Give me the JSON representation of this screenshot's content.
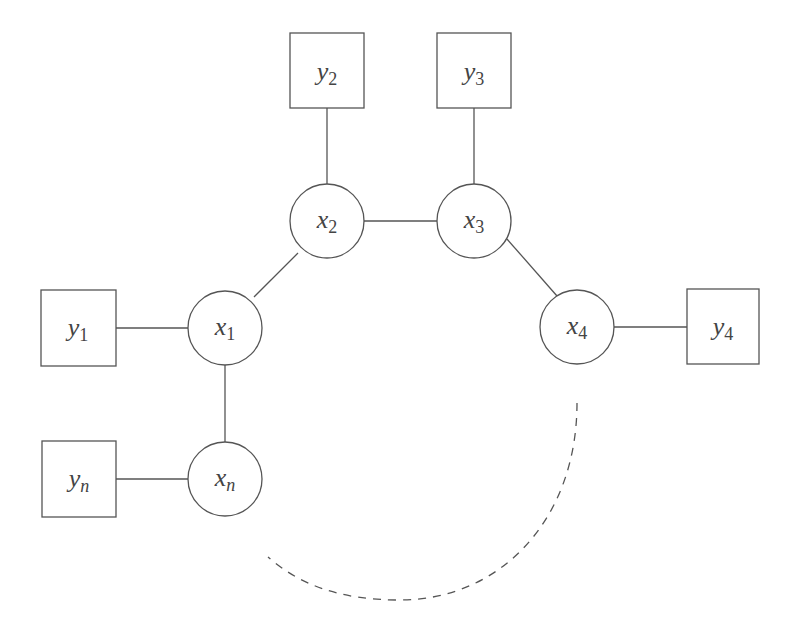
{
  "diagram": {
    "type": "graphical-model",
    "hidden_nodes": [
      {
        "id": "x1",
        "var": "x",
        "sub": "1",
        "cx": 225,
        "cy": 328
      },
      {
        "id": "x2",
        "var": "x",
        "sub": "2",
        "cx": 327,
        "cy": 221
      },
      {
        "id": "x3",
        "var": "x",
        "sub": "3",
        "cx": 474,
        "cy": 221
      },
      {
        "id": "x4",
        "var": "x",
        "sub": "4",
        "cx": 577,
        "cy": 327
      },
      {
        "id": "xn",
        "var": "x",
        "sub": "n",
        "cx": 225,
        "cy": 479
      }
    ],
    "observed_nodes": [
      {
        "id": "y1",
        "var": "y",
        "sub": "1"
      },
      {
        "id": "y2",
        "var": "y",
        "sub": "2"
      },
      {
        "id": "y3",
        "var": "y",
        "sub": "3"
      },
      {
        "id": "y4",
        "var": "y",
        "sub": "4"
      },
      {
        "id": "yn",
        "var": "y",
        "sub": "n"
      }
    ],
    "edges": [
      [
        "y1",
        "x1"
      ],
      [
        "y2",
        "x2"
      ],
      [
        "y3",
        "x3"
      ],
      [
        "y4",
        "x4"
      ],
      [
        "yn",
        "xn"
      ],
      [
        "x1",
        "x2"
      ],
      [
        "x2",
        "x3"
      ],
      [
        "x3",
        "x4"
      ],
      [
        "x1",
        "xn"
      ]
    ],
    "dashed_connection": [
      "x4",
      "xn"
    ],
    "colors": {
      "stroke": "#555555",
      "text": "#444444",
      "background": "#ffffff"
    }
  }
}
